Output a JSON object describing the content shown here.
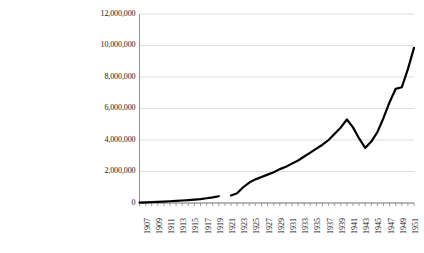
{
  "chart_data": {
    "type": "line",
    "title": "",
    "xlabel": "",
    "ylabel": "",
    "xlim": [
      1907,
      1952
    ],
    "ylim": [
      0,
      12000000
    ],
    "ytick_values": [
      0,
      2000000,
      4000000,
      6000000,
      8000000,
      10000000,
      12000000
    ],
    "ytick_labels": [
      "0",
      "2,000,000",
      "4,000,000",
      "6,000,000",
      "8,000,000",
      "10,000,000",
      "12,000,000"
    ],
    "xtick_labels": [
      "1907",
      "1909",
      "1911",
      "1913",
      "1915",
      "1917",
      "1919",
      "1921",
      "1923",
      "1925",
      "1927",
      "1929",
      "1931",
      "1933",
      "1935",
      "1937",
      "1939",
      "1941",
      "1943",
      "1945",
      "1947",
      "1949",
      "1951"
    ],
    "grid": true,
    "grid_color": "#d9d9d9",
    "axis_color": "#868686",
    "line_color": "#000000",
    "line_width": 2.2,
    "legend": false,
    "legend_position": "none",
    "series": [
      {
        "name": "series-1",
        "x": [
          1907,
          1908,
          1909,
          1910,
          1911,
          1912,
          1913,
          1914,
          1915,
          1916,
          1917,
          1918,
          1919,
          1920
        ],
        "values": [
          30000,
          40000,
          55000,
          70000,
          90000,
          110000,
          135000,
          160000,
          185000,
          215000,
          250000,
          300000,
          360000,
          430000
        ]
      },
      {
        "name": "series-1-continued",
        "x": [
          1922,
          1923,
          1924,
          1925,
          1926,
          1927,
          1928,
          1929,
          1930,
          1931,
          1932,
          1933,
          1934,
          1935,
          1936,
          1937,
          1938,
          1939,
          1940,
          1941,
          1942,
          1943,
          1944,
          1945,
          1946,
          1947,
          1948,
          1949,
          1950,
          1951,
          1952
        ],
        "values": [
          480000,
          620000,
          1000000,
          1300000,
          1500000,
          1650000,
          1800000,
          1950000,
          2150000,
          2300000,
          2500000,
          2700000,
          2950000,
          3200000,
          3450000,
          3700000,
          4000000,
          4400000,
          4800000,
          5300000,
          4800000,
          4100000,
          3500000,
          3900000,
          4500000,
          5400000,
          6400000,
          7250000,
          7350000,
          8500000,
          9850000
        ]
      }
    ]
  }
}
